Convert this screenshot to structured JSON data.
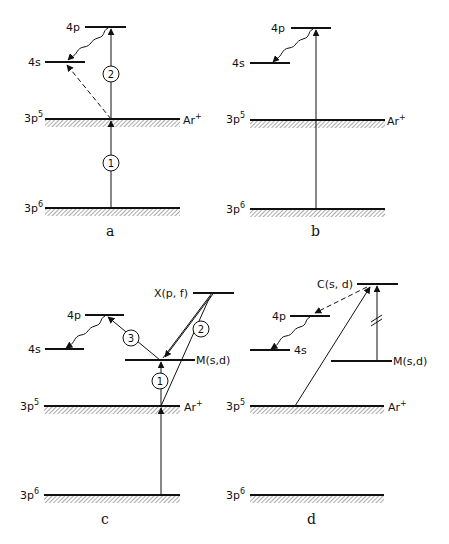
{
  "figure": {
    "panels": [
      {
        "id": "a",
        "label": "a",
        "levels": {
          "p4": {
            "label": "4p"
          },
          "s4": {
            "label": "4s"
          },
          "p5": {
            "label": "3p",
            "sup": "5",
            "right_label": "Ar",
            "right_sup": "+"
          },
          "p6": {
            "label": "3p",
            "sup": "6"
          }
        },
        "steps": [
          "1",
          "2"
        ]
      },
      {
        "id": "b",
        "label": "b",
        "levels": {
          "p4": {
            "label": "4p"
          },
          "s4": {
            "label": "4s"
          },
          "p5": {
            "label": "3p",
            "sup": "5",
            "right_label": "Ar",
            "right_sup": "+"
          },
          "p6": {
            "label": "3p",
            "sup": "6"
          }
        }
      },
      {
        "id": "c",
        "label": "c",
        "levels": {
          "x": {
            "label": "X(p, f)"
          },
          "p4": {
            "label": "4p"
          },
          "s4": {
            "label": "4s"
          },
          "m": {
            "label": "M(s,d)"
          },
          "p5": {
            "label": "3p",
            "sup": "5",
            "right_label": "Ar",
            "right_sup": "+"
          },
          "p6": {
            "label": "3p",
            "sup": "6"
          }
        },
        "steps": [
          "1",
          "2",
          "3"
        ]
      },
      {
        "id": "d",
        "label": "d",
        "levels": {
          "c": {
            "label": "C(s, d)"
          },
          "p4": {
            "label": "4p"
          },
          "s4": {
            "label": "4s"
          },
          "m": {
            "label": "M(s,d)"
          },
          "p5": {
            "label": "3p",
            "sup": "5",
            "right_label": "Ar",
            "right_sup": "+"
          },
          "p6": {
            "label": "3p",
            "sup": "6"
          }
        }
      }
    ],
    "colors": {
      "ink": "#111111",
      "background": "#ffffff"
    }
  }
}
